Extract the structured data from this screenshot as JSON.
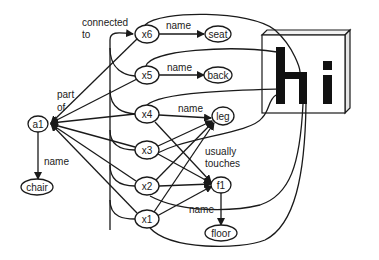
{
  "diagram": {
    "nodes": {
      "a1": "a1",
      "chair": "chair",
      "x1": "x1",
      "x2": "x2",
      "x3": "x3",
      "x4": "x4",
      "x5": "x5",
      "x6": "x6",
      "seat": "seat",
      "back": "back",
      "leg": "leg",
      "f1": "f1",
      "floor": "floor"
    },
    "edge_labels": {
      "connected_to_1": "connected",
      "connected_to_2": "to",
      "part_of_1": "part",
      "part_of_2": "of",
      "a1_name": "name",
      "x6_name": "name",
      "x5_name": "name",
      "x4_name": "name",
      "usually_touches_1": "usually",
      "usually_touches_2": "touches",
      "f1_name": "name"
    },
    "image_box": {
      "text": "hi"
    },
    "colors": {
      "stroke": "#1a1a1a",
      "background": "#ffffff"
    }
  }
}
